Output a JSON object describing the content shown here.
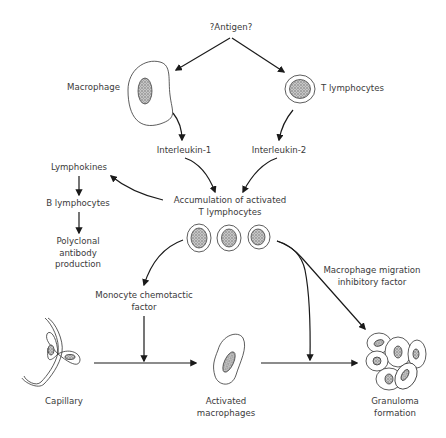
{
  "diagram": {
    "nodes": {
      "antigen": "?Antigen?",
      "macrophage": "Macrophage",
      "t_lymphocytes": "T lymphocytes",
      "interleukin1": "Interleukin-1",
      "interleukin2": "Interleukin-2",
      "accumulation": [
        "Accumulation of activated",
        "T lymphocytes"
      ],
      "lymphokines": "Lymphokines",
      "b_lymphocytes": "B lymphocytes",
      "polyclonal": [
        "Polyclonal",
        "antibody",
        "production"
      ],
      "monocyte_factor": [
        "Monocyte chemotactic",
        "factor"
      ],
      "mif": [
        "Macrophage migration",
        "inhibitory factor"
      ],
      "capillary": "Capillary",
      "activated_macrophages": [
        "Activated",
        "macrophages"
      ],
      "granuloma": [
        "Granuloma",
        "formation"
      ]
    },
    "edges": [
      {
        "from": "antigen",
        "to": "macrophage"
      },
      {
        "from": "antigen",
        "to": "t_lymphocytes"
      },
      {
        "from": "macrophage",
        "to": "interleukin1"
      },
      {
        "from": "t_lymphocytes",
        "to": "interleukin2"
      },
      {
        "from": "interleukin1",
        "to": "accumulation"
      },
      {
        "from": "interleukin2",
        "to": "accumulation"
      },
      {
        "from": "accumulation",
        "to": "lymphokines"
      },
      {
        "from": "lymphokines",
        "to": "b_lymphocytes"
      },
      {
        "from": "b_lymphocytes",
        "to": "polyclonal"
      },
      {
        "from": "accumulation",
        "to": "monocyte_factor"
      },
      {
        "from": "monocyte_factor",
        "to": "capillary_to_macrophage_path"
      },
      {
        "from": "capillary",
        "to": "activated_macrophages"
      },
      {
        "from": "activated_macrophages",
        "to": "granuloma"
      },
      {
        "from": "accumulation",
        "to": "macrophage_to_granuloma_path"
      },
      {
        "from": "accumulation",
        "to": "granuloma",
        "label": "mif"
      }
    ],
    "colors": {
      "line": "#1a1a1a",
      "cell_outline": "#333333",
      "nucleus_fill": "#9a9a9a",
      "text": "#3a3a3a"
    }
  }
}
